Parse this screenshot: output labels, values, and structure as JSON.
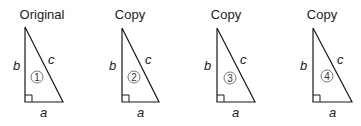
{
  "figure": {
    "triangles": [
      {
        "title": "Original",
        "number": "1",
        "side_a": "a",
        "side_b": "b",
        "side_c": "c"
      },
      {
        "title": "Copy",
        "number": "2",
        "side_a": "a",
        "side_b": "b",
        "side_c": "c"
      },
      {
        "title": "Copy",
        "number": "3",
        "side_a": "a",
        "side_b": "b",
        "side_c": "c"
      },
      {
        "title": "Copy",
        "number": "4",
        "side_a": "a",
        "side_b": "b",
        "side_c": "c"
      }
    ],
    "colors": {
      "stroke": "#1a1a1a",
      "text": "#222222",
      "circle": "#555555"
    }
  }
}
